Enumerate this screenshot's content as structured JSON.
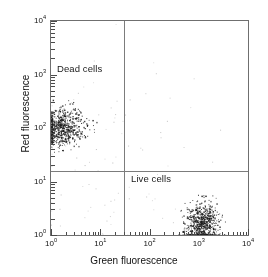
{
  "chart_data": {
    "type": "scatter",
    "title": "",
    "xlabel": "Green fluorescence",
    "ylabel": "Red fluorescence",
    "xscale": "log",
    "yscale": "log",
    "xlim": [
      1,
      10000
    ],
    "ylim": [
      1,
      10000
    ],
    "grid": false,
    "legend": "none",
    "xticklabels": [
      "10<sup>0</sup>",
      "10<sup>1</sup>",
      "10<sup>2</sup>",
      "10<sup>3</sup>",
      "10<sup>4</sup>"
    ],
    "yticklabels": [
      "10<sup>0</sup>",
      "10<sup>1</sup>",
      "10<sup>2</sup>",
      "10<sup>3</sup>",
      "10<sup>4</sup>"
    ],
    "xtickvalues": [
      1,
      10,
      100,
      1000,
      10000
    ],
    "ytickvalues": [
      1,
      10,
      100,
      1000,
      10000
    ],
    "quadrant_gates": {
      "x_gate": 30,
      "y_gate": 16
    },
    "annotations": [
      {
        "text": "Dead cells",
        "x": 1.6,
        "y": 1100
      },
      {
        "text": "Live cells",
        "x": 110,
        "y": 11
      }
    ],
    "series": [
      {
        "name": "Dead cells",
        "color": "#1a1a1a",
        "n_points": 640,
        "cluster": {
          "x_center_log10": 0.22,
          "x_sigma_log10": 0.22,
          "y_center_log10": 2.02,
          "y_sigma_log10": 0.17
        }
      },
      {
        "name": "Live cells",
        "color": "#1a1a1a",
        "n_points": 700,
        "cluster": {
          "x_center_log10": 3.05,
          "x_sigma_log10": 0.17,
          "y_center_log10": 0.18,
          "y_sigma_log10": 0.22
        }
      },
      {
        "name": "Background debris",
        "color": "#9a9a9a",
        "n_points": 90,
        "cluster": {
          "x_center_log10": 1.3,
          "x_sigma_log10": 0.95,
          "y_center_log10": 1.5,
          "y_sigma_log10": 0.85
        }
      }
    ]
  },
  "axes": {
    "x_title": "Green fluorescence",
    "y_title": "Red fluorescence",
    "x_ticks": [
      {
        "label_html": "10<sup>0</sup>",
        "value": 1
      },
      {
        "label_html": "10<sup>1</sup>",
        "value": 10
      },
      {
        "label_html": "10<sup>2</sup>",
        "value": 100
      },
      {
        "label_html": "10<sup>3</sup>",
        "value": 1000
      },
      {
        "label_html": "10<sup>4</sup>",
        "value": 10000
      }
    ],
    "y_ticks": [
      {
        "label_html": "10<sup>4</sup>",
        "value": 10000
      },
      {
        "label_html": "10<sup>3</sup>",
        "value": 1000
      },
      {
        "label_html": "10<sup>2</sup>",
        "value": 100
      },
      {
        "label_html": "10<sup>1</sup>",
        "value": 10
      },
      {
        "label_html": "10<sup>0</sup>",
        "value": 1
      }
    ]
  },
  "labels": {
    "dead_cells": "Dead cells",
    "live_cells": "Live cells"
  },
  "colors": {
    "frame": "#6f6f6f",
    "divider": "#7c7c7c",
    "point_dense": "#1a1a1a",
    "point_sparse": "#9a9a9a",
    "text": "#111111",
    "background": "#ffffff"
  }
}
